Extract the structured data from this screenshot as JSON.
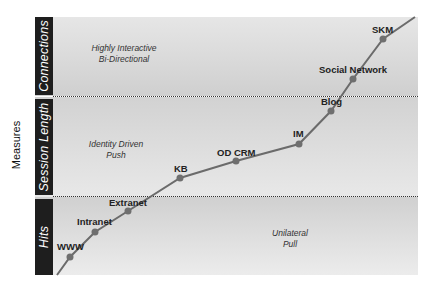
{
  "axis": {
    "ylabel": "Measures"
  },
  "bands": [
    {
      "key": "connections",
      "title": "Connections",
      "desc_line1": "Highly Interactive",
      "desc_line2": "Bi-Directional"
    },
    {
      "key": "session_length",
      "title": "Session Length",
      "desc_line1": "Identity Driven",
      "desc_line2": "Push"
    },
    {
      "key": "hits",
      "title": "Hits",
      "desc_line1": "Unilateral",
      "desc_line2": "Pull"
    }
  ],
  "points": [
    {
      "label": "WWW",
      "band": "Hits"
    },
    {
      "label": "Intranet",
      "band": "Hits"
    },
    {
      "label": "Extranet",
      "band": "Hits"
    },
    {
      "label": "KB",
      "band": "Session Length"
    },
    {
      "label": "OD CRM",
      "band": "Session Length"
    },
    {
      "label": "IM",
      "band": "Session Length"
    },
    {
      "label": "Blog",
      "band": "Session Length"
    },
    {
      "label": "Social Network",
      "band": "Connections"
    },
    {
      "label": "SKM",
      "band": "Connections"
    }
  ],
  "colors": {
    "line": "#6b6b6b",
    "marker": "#6f6f6f",
    "tab_bg": "#1e1e1e",
    "tab_text": "#ffffff"
  }
}
